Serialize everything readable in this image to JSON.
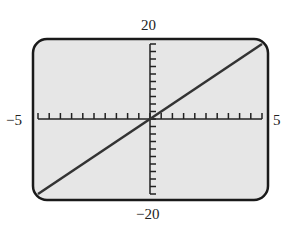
{
  "chart_data": {
    "type": "line",
    "title": "",
    "xlabel": "",
    "ylabel": "",
    "xlim": [
      -5,
      5
    ],
    "ylim": [
      -20,
      20
    ],
    "x_tick_step": 0.5,
    "y_tick_step": 2,
    "grid": false,
    "series": [
      {
        "name": "y = 4x",
        "x": [
          -5,
          5
        ],
        "values": [
          -20,
          20
        ]
      }
    ],
    "tick_labels": {
      "x_min": "−5",
      "x_max": "5",
      "y_max": "20",
      "y_min": "−20"
    }
  },
  "colors": {
    "screen_bg": "#e6e6e6",
    "frame": "#1a1a1a",
    "line": "#333333"
  }
}
